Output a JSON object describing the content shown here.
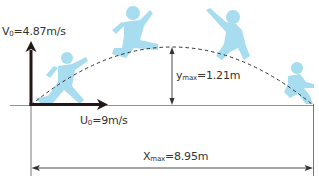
{
  "diagram": {
    "colors": {
      "figure": "#a8dcef",
      "vector": "#231815",
      "line": "#555555",
      "dash": "#333333",
      "text": "#333333"
    },
    "labels": {
      "v0": {
        "symbol": "V",
        "sub": "0",
        "value": "=4.87m/s"
      },
      "u0": {
        "symbol": "U",
        "sub": "0",
        "value": "=9m/s"
      },
      "ymax": {
        "symbol": "y",
        "sub": "max",
        "value": "=1.21m"
      },
      "xmax": {
        "symbol": "X",
        "sub": "max",
        "value": "=8.95m"
      }
    },
    "quantities": {
      "initial_vertical_velocity": "4.87 m/s",
      "initial_horizontal_velocity": "9 m/s",
      "max_height": "1.21 m",
      "max_range": "8.95 m"
    },
    "figures": [
      {
        "pose": "takeoff-running"
      },
      {
        "pose": "rising-leap"
      },
      {
        "pose": "descending-arm-raised"
      },
      {
        "pose": "landing-crouch"
      }
    ]
  }
}
